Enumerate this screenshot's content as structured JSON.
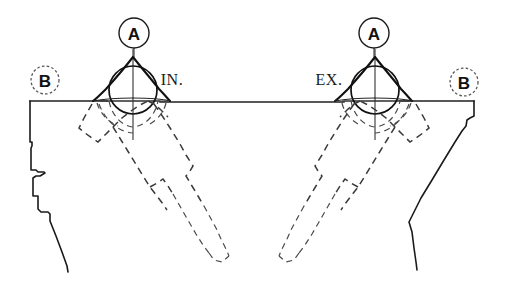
{
  "figure": {
    "background_color": "#ffffff",
    "line_color": "#1a1a1a",
    "hidden_line_color": "#3a3a3a",
    "width": 506,
    "height": 283
  },
  "callouts": [
    {
      "id": "a-left",
      "label": "A",
      "cx": 134,
      "cy": 33,
      "r": 15,
      "ring_style": "solid"
    },
    {
      "id": "a-right",
      "label": "A",
      "cx": 374,
      "cy": 33,
      "r": 15,
      "ring_style": "solid"
    },
    {
      "id": "b-left",
      "label": "B",
      "cx": 45,
      "cy": 80,
      "r": 14,
      "ring_style": "dashed"
    },
    {
      "id": "b-right",
      "label": "B",
      "cx": 464,
      "cy": 82,
      "r": 14,
      "ring_style": "dashed"
    }
  ],
  "port_labels": [
    {
      "id": "intake",
      "text": "IN.",
      "x": 172,
      "y": 79
    },
    {
      "id": "exhaust",
      "text": "EX.",
      "x": 329,
      "y": 79
    }
  ],
  "valves": [
    {
      "id": "intake-valve",
      "name": "IN.",
      "center_x": 133,
      "head_center_y": 90,
      "head_radius": 24,
      "stem_angle_deg": 35,
      "stem_direction": "down-right",
      "hidden": true
    },
    {
      "id": "exhaust-valve",
      "name": "EX.",
      "center_x": 375,
      "head_center_y": 90,
      "head_radius": 24,
      "stem_angle_deg": 35,
      "stem_direction": "down-left",
      "hidden": true
    }
  ],
  "deck": {
    "id": "deck-line",
    "y": 101,
    "x_start": 30,
    "x_end": 474
  },
  "geometry": {
    "left_wall_profile": "stepped casting wall",
    "right_wall_profile": "tapered casting wall",
    "symmetry": "mirror about vertical centre"
  }
}
